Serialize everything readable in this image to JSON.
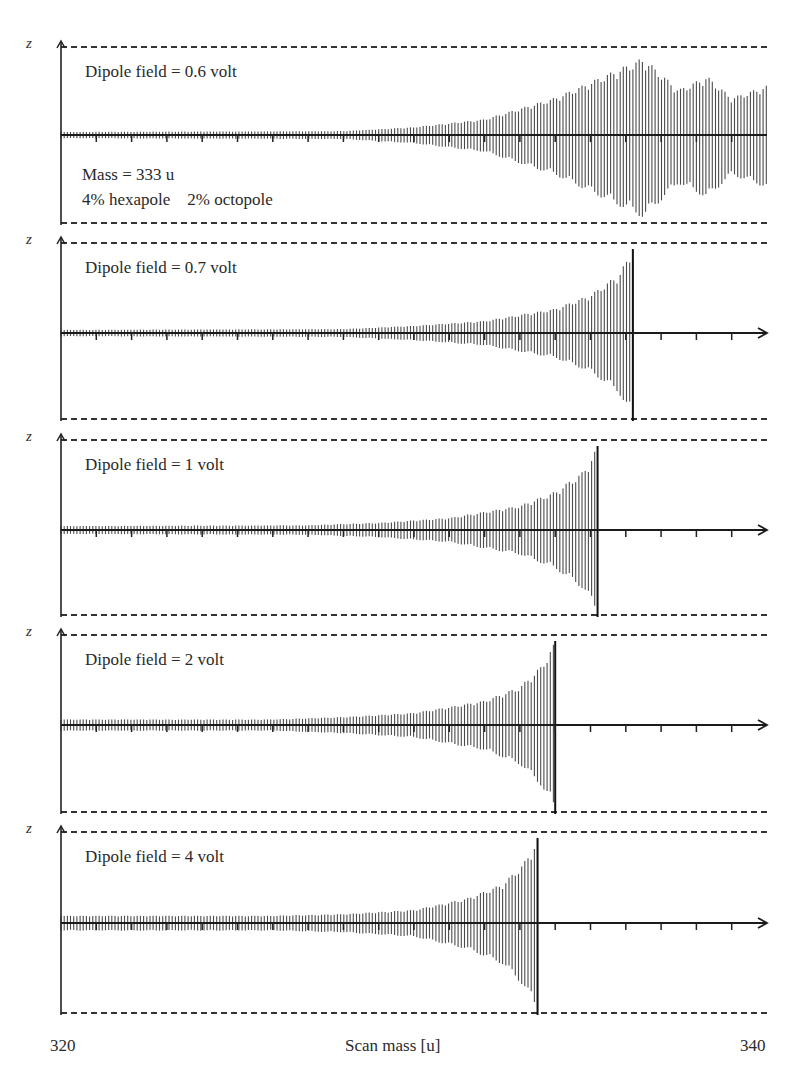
{
  "figure": {
    "y_axis_symbol": "z",
    "x_axis_label": "Scan mass [u]",
    "x_min_label": "320",
    "x_max_label": "340",
    "annotations": {
      "mass": "Mass = 333 u",
      "multipoles": "4% hexapole    2% octopole"
    },
    "panels": [
      {
        "label": "Dipole field = 0.6 volt"
      },
      {
        "label": "Dipole field = 0.7 volt"
      },
      {
        "label": "Dipole field = 1 volt"
      },
      {
        "label": "Dipole field = 2 volt"
      },
      {
        "label": "Dipole field = 4 volt"
      }
    ]
  },
  "chart_data": {
    "type": "line",
    "title": "",
    "xlabel": "Scan mass [u]",
    "ylabel": "z",
    "xlim": [
      320,
      340
    ],
    "x_ticks_step": 1,
    "grid": false,
    "legend": null,
    "annotations": [
      "Mass = 333 u",
      "4% hexapole",
      "2% octopole"
    ],
    "series": [
      {
        "name": "Dipole field = 0.6 volt",
        "dipole_volt": 0.6,
        "ejected": false,
        "description": "oscillation grows from ~330 u, beat pattern up to 340 u, not ejected",
        "envelope_x": [
          320,
          328,
          330,
          332,
          334,
          335.5,
          336.5,
          337.5,
          338.3,
          339,
          340
        ],
        "envelope_amp": [
          0.02,
          0.03,
          0.08,
          0.18,
          0.45,
          0.75,
          0.95,
          0.55,
          0.72,
          0.45,
          0.6
        ]
      },
      {
        "name": "Dipole field = 0.7 volt",
        "dipole_volt": 0.7,
        "ejected": true,
        "ejection_mass": 336.2,
        "envelope_x": [
          320,
          328,
          330,
          332,
          334,
          335,
          335.8,
          336.2
        ],
        "envelope_amp": [
          0.02,
          0.03,
          0.07,
          0.13,
          0.28,
          0.45,
          0.7,
          1.0
        ]
      },
      {
        "name": "Dipole field = 1 volt",
        "dipole_volt": 1,
        "ejected": true,
        "ejection_mass": 335.2,
        "envelope_x": [
          320,
          327,
          329,
          331,
          333,
          334,
          334.8,
          335.2
        ],
        "envelope_amp": [
          0.03,
          0.04,
          0.07,
          0.13,
          0.28,
          0.45,
          0.7,
          1.0
        ]
      },
      {
        "name": "Dipole field = 2 volt",
        "dipole_volt": 2,
        "ejected": true,
        "ejection_mass": 334.0,
        "envelope_x": [
          320,
          326,
          328,
          330,
          332,
          333,
          333.6,
          334.0
        ],
        "envelope_amp": [
          0.05,
          0.05,
          0.08,
          0.13,
          0.28,
          0.45,
          0.7,
          1.0
        ]
      },
      {
        "name": "Dipole field = 4 volt",
        "dipole_volt": 4,
        "ejected": true,
        "ejection_mass": 333.5,
        "envelope_x": [
          320,
          326,
          328,
          330,
          331.5,
          332.5,
          333.1,
          333.5
        ],
        "envelope_amp": [
          0.07,
          0.07,
          0.09,
          0.14,
          0.28,
          0.45,
          0.7,
          1.0
        ]
      }
    ]
  }
}
